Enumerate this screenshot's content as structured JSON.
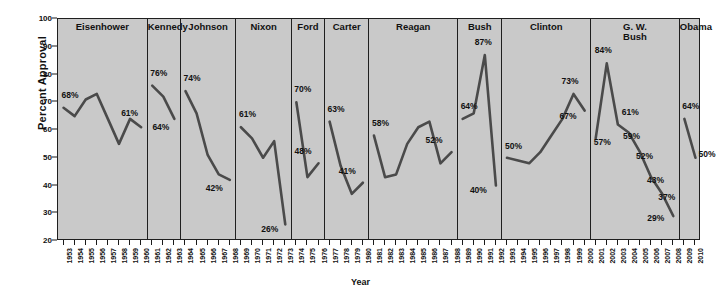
{
  "chart_data": {
    "type": "line",
    "title": "",
    "xlabel": "Year",
    "ylabel": "Percent Approval",
    "ylim": [
      20,
      100
    ],
    "yticks": [
      100,
      90,
      80,
      70,
      60,
      50,
      40,
      30,
      20
    ],
    "grid": false,
    "legend": "none",
    "line_color": "#4a4a4a",
    "panel_bg": "#c9c9c9",
    "axis_color": "#1f1f1f",
    "panels": [
      {
        "name": "Eisenhower",
        "x_start": 1953,
        "years": [
          1953,
          1954,
          1955,
          1956,
          1957,
          1958,
          1959,
          1960
        ],
        "values": [
          68,
          65,
          71,
          73,
          64,
          55,
          64,
          61
        ],
        "annotations": [
          {
            "year": 1953,
            "value": 68,
            "label": "68%",
            "dx": -2,
            "dy": -13
          },
          {
            "year": 1960,
            "value": 61,
            "label": "61%",
            "dx": -20,
            "dy": -14
          }
        ]
      },
      {
        "name": "Kennedy",
        "x_start": 1961,
        "years": [
          1961,
          1962,
          1963
        ],
        "values": [
          76,
          72,
          64
        ],
        "annotations": [
          {
            "year": 1961,
            "value": 76,
            "label": "76%",
            "dx": -2,
            "dy": -13
          },
          {
            "year": 1963,
            "value": 64,
            "label": "64%",
            "dx": -22,
            "dy": 8
          }
        ]
      },
      {
        "name": "Johnson",
        "x_start": 1964,
        "years": [
          1964,
          1965,
          1966,
          1967,
          1968
        ],
        "values": [
          74,
          66,
          51,
          44,
          42
        ],
        "annotations": [
          {
            "year": 1964,
            "value": 74,
            "label": "74%",
            "dx": -2,
            "dy": -13
          },
          {
            "year": 1968,
            "value": 42,
            "label": "42%",
            "dx": -24,
            "dy": 8
          }
        ]
      },
      {
        "name": "Nixon",
        "x_start": 1969,
        "years": [
          1969,
          1970,
          1971,
          1972,
          1973
        ],
        "values": [
          61,
          57,
          50,
          56,
          26
        ],
        "annotations": [
          {
            "year": 1969,
            "value": 61,
            "label": "61%",
            "dx": -2,
            "dy": -13
          },
          {
            "year": 1973,
            "value": 26,
            "label": "26%",
            "dx": -24,
            "dy": 5
          }
        ]
      },
      {
        "name": "Ford",
        "x_start": 1974,
        "years": [
          1974,
          1975,
          1976
        ],
        "values": [
          70,
          43,
          48
        ],
        "annotations": [
          {
            "year": 1974,
            "value": 70,
            "label": "70%",
            "dx": -2,
            "dy": -13
          },
          {
            "year": 1976,
            "value": 48,
            "label": "48%",
            "dx": -24,
            "dy": -12
          }
        ]
      },
      {
        "name": "Carter",
        "x_start": 1977,
        "years": [
          1977,
          1978,
          1979,
          1980
        ],
        "values": [
          63,
          47,
          37,
          41
        ],
        "annotations": [
          {
            "year": 1977,
            "value": 63,
            "label": "63%",
            "dx": -2,
            "dy": -13
          },
          {
            "year": 1980,
            "value": 41,
            "label": "41%",
            "dx": -24,
            "dy": -12
          }
        ]
      },
      {
        "name": "Reagan",
        "x_start": 1981,
        "years": [
          1981,
          1982,
          1983,
          1984,
          1985,
          1986,
          1987,
          1988
        ],
        "values": [
          58,
          43,
          44,
          55,
          61,
          63,
          48,
          52
        ],
        "annotations": [
          {
            "year": 1981,
            "value": 58,
            "label": "58%",
            "dx": -2,
            "dy": -13
          },
          {
            "year": 1988,
            "value": 52,
            "label": "52%",
            "dx": -26,
            "dy": -12
          }
        ]
      },
      {
        "name": "Bush",
        "x_start": 1989,
        "years": [
          1989,
          1990,
          1991,
          1992
        ],
        "values": [
          64,
          66,
          87,
          40
        ],
        "annotations": [
          {
            "year": 1989,
            "value": 64,
            "label": "64%",
            "dx": -2,
            "dy": -13
          },
          {
            "year": 1991,
            "value": 87,
            "label": "87%",
            "dx": -10,
            "dy": -13
          },
          {
            "year": 1992,
            "value": 40,
            "label": "40%",
            "dx": -26,
            "dy": 4
          }
        ]
      },
      {
        "name": "Clinton",
        "x_start": 1993,
        "years": [
          1993,
          1994,
          1995,
          1996,
          1997,
          1998,
          1999,
          2000
        ],
        "values": [
          50,
          49,
          48,
          52,
          58,
          64,
          73,
          67
        ],
        "annotations": [
          {
            "year": 1993,
            "value": 50,
            "label": "50%",
            "dx": -2,
            "dy": -12
          },
          {
            "year": 1999,
            "value": 73,
            "label": "73%",
            "dx": -12,
            "dy": -13
          },
          {
            "year": 2000,
            "value": 67,
            "label": "67%",
            "dx": -25,
            "dy": 5
          }
        ]
      },
      {
        "name": "G. W. Bush",
        "x_start": 2001,
        "years": [
          2001,
          2002,
          2003,
          2004,
          2005,
          2006,
          2007,
          2008
        ],
        "values": [
          57,
          84,
          62,
          59,
          52,
          43,
          37,
          29
        ],
        "annotations": [
          {
            "year": 2001,
            "value": 57,
            "label": "57%",
            "dx": -2,
            "dy": 4
          },
          {
            "year": 2002,
            "value": 84,
            "label": "84%",
            "dx": -12,
            "dy": -13
          },
          {
            "year": 2003,
            "value": 62,
            "label": "61%",
            "dx": 4,
            "dy": -12
          },
          {
            "year": 2004,
            "value": 59,
            "label": "59%",
            "dx": -6,
            "dy": 3
          },
          {
            "year": 2005,
            "value": 52,
            "label": "52%",
            "dx": -4,
            "dy": 4
          },
          {
            "year": 2006,
            "value": 43,
            "label": "43%",
            "dx": -4,
            "dy": 3
          },
          {
            "year": 2007,
            "value": 37,
            "label": "37%",
            "dx": -4,
            "dy": 3
          },
          {
            "year": 2008,
            "value": 29,
            "label": "29%",
            "dx": -26,
            "dy": 2
          }
        ]
      },
      {
        "name": "Obama",
        "x_start": 2009,
        "years": [
          2009,
          2010
        ],
        "values": [
          64,
          50
        ],
        "annotations": [
          {
            "year": 2009,
            "value": 64,
            "label": "64%",
            "dx": -2,
            "dy": -13
          },
          {
            "year": 2010,
            "value": 50,
            "label": "50%",
            "dx": 3,
            "dy": -4
          }
        ]
      }
    ]
  }
}
